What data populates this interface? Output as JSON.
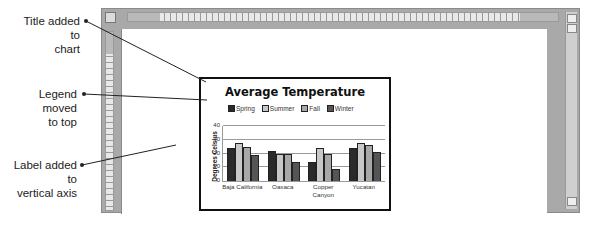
{
  "callouts": [
    {
      "id": "title",
      "text_line1": "Title added to",
      "text_line2": "chart"
    },
    {
      "id": "legend",
      "text_line1": "Legend moved",
      "text_line2": "to top"
    },
    {
      "id": "axis",
      "text_line1": "Label added to",
      "text_line2": "vertical axis"
    }
  ],
  "chart_data": {
    "type": "bar",
    "title": "Average Temperature",
    "xlabel": "",
    "ylabel": "Degrees Celsius",
    "ylim": [
      0,
      40
    ],
    "yticks": [
      "40",
      "30",
      "20",
      "10",
      "0"
    ],
    "grid": true,
    "legend_position": "top",
    "categories": [
      "Baja California",
      "Oaxaca",
      "Copper Canyon",
      "Yucatan"
    ],
    "category_lines": [
      [
        "Baja California"
      ],
      [
        "Oaxaca"
      ],
      [
        "Copper",
        "Canyon"
      ],
      [
        "Yucatan"
      ]
    ],
    "series": [
      {
        "name": "Spring",
        "color": "#2a2a2a",
        "values": [
          24,
          22,
          14,
          24
        ]
      },
      {
        "name": "Summer",
        "color": "#c8c8c8",
        "values": [
          28,
          20,
          24,
          28
        ]
      },
      {
        "name": "Fall",
        "color": "#a8a8a8",
        "values": [
          25,
          20,
          20,
          26
        ]
      },
      {
        "name": "Winter",
        "color": "#555555",
        "values": [
          19,
          14,
          9,
          21
        ]
      }
    ]
  }
}
